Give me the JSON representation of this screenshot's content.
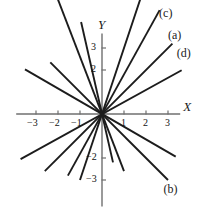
{
  "figure": {
    "background": "#ffffff",
    "line_color": "#1c1c1c",
    "axis_color": "#6f6f6f"
  },
  "chart_data": {
    "type": "line",
    "title": "",
    "xlabel": "X",
    "ylabel": "Y",
    "xlim": [
      -3.9,
      4.1
    ],
    "ylim": [
      -4.2,
      4.3
    ],
    "grid": false,
    "legend": "inline-end-labels",
    "origin_px": [
      102,
      114
    ],
    "unit_px": 22,
    "x_ticks": [
      -3,
      -2,
      -1,
      1,
      2,
      3
    ],
    "x_tick_labels": [
      "−3",
      "−2",
      "−1",
      "1",
      "2",
      "3"
    ],
    "y_ticks": [
      3,
      2,
      -2,
      -3
    ],
    "y_tick_labels": [
      "3",
      "2",
      "−2",
      "−3"
    ],
    "series": [
      {
        "name": "(a)",
        "label": "(a)",
        "slope": 1.0,
        "x": [
          -2.6,
          3.2
        ],
        "y": [
          -2.6,
          3.2
        ],
        "label_pos": [
          3.45,
          3.55
        ]
      },
      {
        "name": "(b)",
        "label": "(b)",
        "slope": -1.0,
        "x": [
          -2.35,
          3.0
        ],
        "y": [
          2.35,
          -3.0
        ],
        "label_pos": [
          3.25,
          -3.45
        ]
      },
      {
        "name": "(c)",
        "label": "(c)",
        "slope": 1.8,
        "x": [
          -1.55,
          2.62
        ],
        "y": [
          -2.8,
          4.72
        ],
        "label_pos": [
          3.05,
          4.55
        ]
      },
      {
        "name": "(d)",
        "label": "(d)",
        "slope": 0.55,
        "x": [
          -3.7,
          3.62
        ],
        "y": [
          -2.05,
          1.99
        ],
        "label_pos": [
          3.85,
          2.75
        ]
      },
      {
        "name": "(e)",
        "label": "(e)",
        "slope": 3.0,
        "x": [
          -1.0,
          2.05
        ],
        "y": [
          -3.0,
          6.15
        ],
        "label_pos": [
          2.3,
          5.95
        ]
      },
      {
        "name": "(f)",
        "label": "(f)",
        "slope": -2.6,
        "x": [
          -2.25,
          1.0
        ],
        "y": [
          5.85,
          -2.6
        ],
        "label_pos": [
          -2.6,
          6.1
        ]
      },
      {
        "name": "unlabeled-steep-negative",
        "label": "",
        "slope": -4.4,
        "x": [
          -0.95,
          0.5
        ],
        "y": [
          4.18,
          -2.2
        ],
        "label_pos": null
      },
      {
        "name": "unlabeled-shallow-negative",
        "label": "",
        "slope": -0.58,
        "x": [
          -3.5,
          3.35
        ],
        "y": [
          2.03,
          -1.94
        ],
        "label_pos": null
      }
    ]
  }
}
